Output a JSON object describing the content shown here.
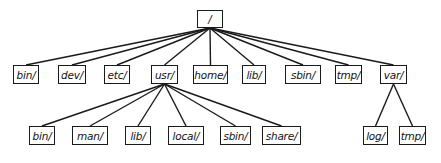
{
  "diagram": {
    "line_color": "#1a1a1a",
    "root": {
      "id": "root",
      "label": "/",
      "x": 197,
      "y": 10,
      "w": 26,
      "h": 18
    },
    "level1": [
      {
        "id": "bin",
        "label": "bin/",
        "x": 13,
        "y": 65,
        "w": 26,
        "h": 19
      },
      {
        "id": "dev",
        "label": "dev/",
        "x": 58,
        "y": 65,
        "w": 28,
        "h": 19
      },
      {
        "id": "etc",
        "label": "etc/",
        "x": 104,
        "y": 65,
        "w": 26,
        "h": 19
      },
      {
        "id": "usr",
        "label": "usr/",
        "x": 151,
        "y": 65,
        "w": 27,
        "h": 19
      },
      {
        "id": "home",
        "label": "home/",
        "x": 193,
        "y": 65,
        "w": 35,
        "h": 19
      },
      {
        "id": "lib",
        "label": "lib/",
        "x": 242,
        "y": 65,
        "w": 24,
        "h": 19
      },
      {
        "id": "sbin",
        "label": "sbin/",
        "x": 285,
        "y": 65,
        "w": 36,
        "h": 19
      },
      {
        "id": "tmp",
        "label": "tmp/",
        "x": 335,
        "y": 65,
        "w": 27,
        "h": 19
      },
      {
        "id": "var",
        "label": "var/",
        "x": 380,
        "y": 65,
        "w": 27,
        "h": 19
      }
    ],
    "level2": [
      {
        "id": "usr-bin",
        "parent": "usr",
        "label": "bin/",
        "x": 29,
        "y": 126,
        "w": 26,
        "h": 19
      },
      {
        "id": "usr-man",
        "parent": "usr",
        "label": "man/",
        "x": 72,
        "y": 126,
        "w": 36,
        "h": 19
      },
      {
        "id": "usr-lib",
        "parent": "usr",
        "label": "lib/",
        "x": 125,
        "y": 126,
        "w": 26,
        "h": 19
      },
      {
        "id": "usr-local",
        "parent": "usr",
        "label": "local/",
        "x": 168,
        "y": 126,
        "w": 36,
        "h": 19
      },
      {
        "id": "usr-sbin",
        "parent": "usr",
        "label": "sbin/",
        "x": 220,
        "y": 126,
        "w": 31,
        "h": 19
      },
      {
        "id": "usr-share",
        "parent": "usr",
        "label": "share/",
        "x": 262,
        "y": 126,
        "w": 39,
        "h": 19
      },
      {
        "id": "var-log",
        "parent": "var",
        "label": "log/",
        "x": 363,
        "y": 126,
        "w": 25,
        "h": 19
      },
      {
        "id": "var-tmp",
        "parent": "var",
        "label": "tmp/",
        "x": 399,
        "y": 126,
        "w": 27,
        "h": 19
      }
    ]
  }
}
